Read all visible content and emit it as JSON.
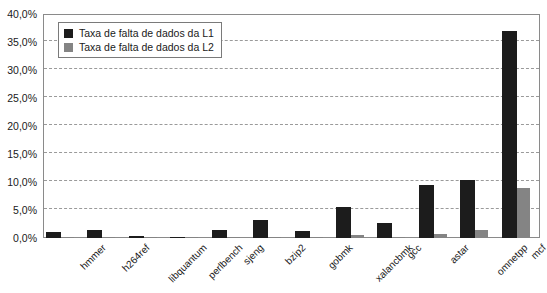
{
  "chart_data": {
    "type": "bar",
    "title": "",
    "xlabel": "",
    "ylabel": "",
    "ylim": [
      0,
      40
    ],
    "grid": true,
    "legend_position": "top-left",
    "y_tick_labels": [
      "0,0%",
      "5,0%",
      "10,0%",
      "15,0%",
      "20,0%",
      "25,0%",
      "30,0%",
      "35,0%",
      "40,0%"
    ],
    "y_tick_values": [
      0,
      5,
      10,
      15,
      20,
      25,
      30,
      35,
      40
    ],
    "categories": [
      "hmmer",
      "h264ref",
      "libquantum",
      "perlbench",
      "sjeng",
      "bzip2",
      "gobmk",
      "xalancbmk",
      "gcc",
      "astar",
      "omnetpp",
      "mcf"
    ],
    "series": [
      {
        "name": "Taxa de falta de dados da L1",
        "color": "#1c1c1c",
        "values": [
          1.1,
          1.4,
          0.4,
          0.15,
          1.4,
          3.2,
          1.3,
          5.5,
          2.6,
          9.5,
          10.3,
          37.0
        ]
      },
      {
        "name": "Taxa de falta de dados da L2",
        "color": "#848484",
        "values": [
          0.05,
          0.05,
          0.2,
          0.1,
          0.05,
          0.1,
          0.05,
          0.6,
          0.1,
          0.8,
          1.5,
          8.9
        ]
      }
    ]
  },
  "legend": {
    "items": [
      {
        "label": "Taxa de falta de dados da L1",
        "swatch": "l1"
      },
      {
        "label": "Taxa de falta de dados da L2",
        "swatch": "l2"
      }
    ]
  }
}
